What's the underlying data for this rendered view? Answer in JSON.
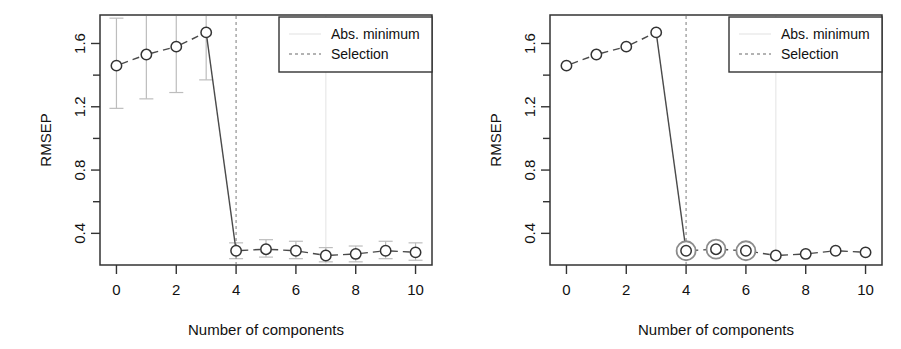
{
  "figure": {
    "panels": [
      {
        "id": "left",
        "name": "rmsep-with-error-bars",
        "show_error_bars": true,
        "highlight_points": []
      },
      {
        "id": "right",
        "name": "rmsep-with-highlighted-selection",
        "show_error_bars": false,
        "highlight_points": [
          4,
          5,
          6
        ]
      }
    ]
  },
  "axes": {
    "x_label": "Number of components",
    "y_label": "RMSEP",
    "x_ticks": [
      "0",
      "2",
      "4",
      "6",
      "8",
      "10"
    ],
    "y_ticks": [
      "0.4",
      "0.8",
      "1.2",
      "1.6"
    ],
    "y_minor_ticks": [
      "0.6",
      "1.0",
      "1.4"
    ]
  },
  "legend": {
    "entries": [
      {
        "label": "Abs. minimum",
        "style": "solid-faint",
        "color": "#e6e6e6"
      },
      {
        "label": "Selection",
        "style": "dashed",
        "color": "#9a9a9a"
      }
    ]
  },
  "colors": {
    "point_stroke": "#333333",
    "line": "#4a4a4a",
    "error_bar": "#bdbdbd",
    "selection_line": "#9a9a9a",
    "abs_min_line": "#e8e8e8",
    "highlight_ring": "#8c8c8c",
    "axis": "#333333",
    "legend_border": "#333333"
  },
  "chart_data": {
    "type": "line",
    "title": "",
    "xlabel": "Number of components",
    "ylabel": "RMSEP",
    "xlim": [
      -0.55,
      10.55
    ],
    "ylim": [
      0.2,
      1.78
    ],
    "grid": false,
    "legend_position": "top-right",
    "x": [
      0,
      1,
      2,
      3,
      4,
      5,
      6,
      7,
      8,
      9,
      10
    ],
    "series": [
      {
        "name": "RMSEP",
        "values": [
          1.46,
          1.53,
          1.58,
          1.67,
          0.29,
          0.3,
          0.29,
          0.26,
          0.27,
          0.29,
          0.28
        ],
        "error_low": [
          1.19,
          1.25,
          1.29,
          1.37,
          0.24,
          0.25,
          0.24,
          0.22,
          0.22,
          0.24,
          0.23
        ],
        "error_high": [
          1.76,
          1.79,
          1.79,
          1.78,
          0.34,
          0.36,
          0.35,
          0.31,
          0.32,
          0.35,
          0.34
        ]
      }
    ],
    "annotations": [
      {
        "name": "selection-line",
        "type": "vline",
        "x": 4,
        "label": "Selection",
        "style": "dashed"
      },
      {
        "name": "abs-minimum-line",
        "type": "vline",
        "x": 7,
        "label": "Abs. minimum",
        "style": "solid-faint"
      }
    ],
    "highlighted": [
      4,
      5,
      6
    ]
  }
}
